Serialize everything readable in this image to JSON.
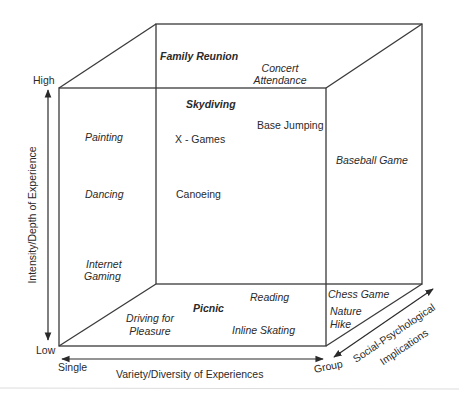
{
  "diagram": {
    "axes": {
      "vertical": {
        "label": "Intensity/Depth of Experience",
        "high": "High",
        "low": "Low"
      },
      "horizontal": {
        "label": "Variety/Diversity of Experiences",
        "left": "Single",
        "right": "Group"
      },
      "depth": {
        "label_line1": "Social-Psychological",
        "label_line2": "Implications"
      }
    },
    "activities": {
      "family_reunion": "Family Reunion",
      "concert_line1": "Concert",
      "concert_line2": "Attendance",
      "skydiving": "Skydiving",
      "painting": "Painting",
      "x_games": "X - Games",
      "base_jumping": "Base Jumping",
      "baseball_game": "Baseball Game",
      "dancing": "Dancing",
      "canoeing": "Canoeing",
      "internet_line1": "Internet",
      "internet_line2": "Gaming",
      "picnic": "Picnic",
      "reading": "Reading",
      "chess_game": "Chess Game",
      "driving_line1": "Driving for",
      "driving_line2": "Pleasure",
      "inline_skating": "Inline Skating",
      "nature_line1": "Nature",
      "nature_line2": "Hike"
    },
    "colors": {
      "line": "#3a3a3a",
      "text": "#2a2a2a",
      "background": "#ffffff"
    }
  }
}
